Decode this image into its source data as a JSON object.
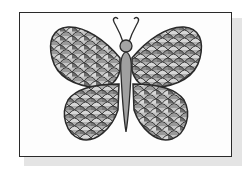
{
  "image": {
    "subject": "butterfly",
    "style": "grayscale scale-pattern coloring drawing",
    "caption": "Butterfly with scale-patterned wings on a white card"
  },
  "colors": {
    "outline": "#2a2a2a",
    "dark_scale": "#6e6e6e",
    "mid_scale": "#a8a8a8",
    "light_scale": "#d2d2d2",
    "body": "#a0a0a0",
    "card": "#fdfdfd",
    "shadow": "#e4e4e4"
  }
}
